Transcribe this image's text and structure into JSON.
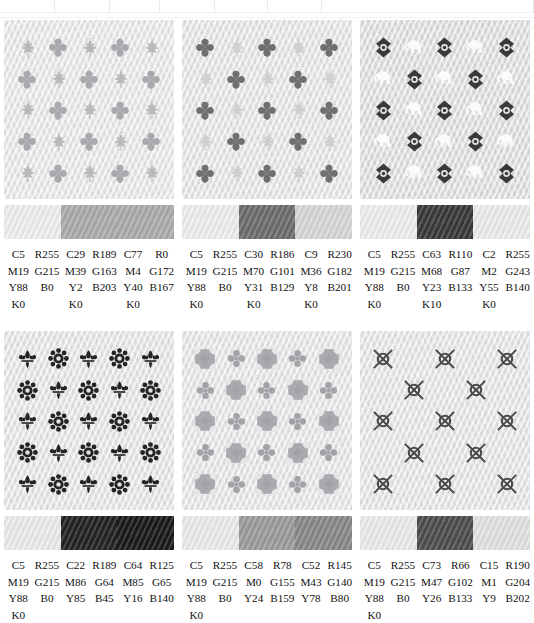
{
  "table_fragment": {
    "visible": true,
    "column_edges_px": [
      55,
      110,
      160,
      215,
      268,
      322,
      534
    ]
  },
  "swatch_rows": [
    {
      "blocks": [
        {
          "pattern": {
            "name": "leaf-and-clover-grid",
            "background": "#e9e9eb",
            "motif_a": "maple-leaf",
            "motif_b": "clover",
            "motif_a_color": "#b9b9bc",
            "motif_b_color": "#a9a9ad",
            "columns": 5,
            "rows": 5
          },
          "bar_segments": [
            "#f0f0ef",
            "#adadad",
            "#adadad"
          ],
          "colors": [
            {
              "c": "C5",
              "m": "M19",
              "y": "Y88",
              "k": "K0",
              "r": "R255",
              "g": "G215",
              "b": "B0"
            },
            {
              "c": "C29",
              "m": "M39",
              "y": "Y2",
              "k": "K0",
              "r": "R189",
              "g": "G163",
              "b": "B203"
            },
            {
              "c": "C77",
              "m": "M4",
              "y": "Y40",
              "k": "K0",
              "r": "R0",
              "g": "G172",
              "b": "B167"
            }
          ]
        },
        {
          "pattern": {
            "name": "clover-and-leaf-grid",
            "background": "#e6e6e8",
            "motif_a": "clover",
            "motif_b": "maple-leaf",
            "motif_a_color": "#6f6f72",
            "motif_b_color": "#cfcfd2",
            "columns": 5,
            "rows": 5
          },
          "bar_segments": [
            "#efefee",
            "#6e6e6e",
            "#d8d8d6"
          ],
          "colors": [
            {
              "c": "C5",
              "m": "M19",
              "y": "Y88",
              "k": "K0",
              "r": "R255",
              "g": "G215",
              "b": "B0"
            },
            {
              "c": "C30",
              "m": "M70",
              "y": "Y31",
              "k": "K0",
              "r": "R186",
              "g": "G101",
              "b": "B129"
            },
            {
              "c": "C9",
              "m": "M36",
              "y": "Y8",
              "k": "K0",
              "r": "R230",
              "g": "G182",
              "b": "B201"
            }
          ]
        },
        {
          "pattern": {
            "name": "rosette-and-elephant-grid",
            "background": "#dededf",
            "motif_a": "rosette-diamond",
            "motif_b": "elephant",
            "motif_a_color": "#3a3a3c",
            "motif_b_color": "#fbfbfb",
            "columns": 5,
            "rows": 5
          },
          "bar_segments": [
            "#efefee",
            "#3b3b3b",
            "#ededeb"
          ],
          "colors": [
            {
              "c": "C5",
              "m": "M19",
              "y": "Y88",
              "k": "K0",
              "r": "R255",
              "g": "G215",
              "b": "B0"
            },
            {
              "c": "C63",
              "m": "M68",
              "y": "Y23",
              "k": "K10",
              "r": "R110",
              "g": "G87",
              "b": "B133"
            },
            {
              "c": "C2",
              "m": "M2",
              "y": "Y55",
              "k": "K0",
              "r": "R255",
              "g": "G243",
              "b": "B140"
            }
          ]
        }
      ]
    },
    {
      "blocks": [
        {
          "pattern": {
            "name": "fleur-de-lis-and-rosette-grid",
            "background": "#e6e6e8",
            "motif_a": "fleur-de-lis",
            "motif_b": "floral-rosette",
            "motif_a_color": "#242426",
            "motif_b_color": "#242426",
            "columns": 5,
            "rows": 5
          },
          "bar_segments": [
            "#ececeb",
            "#242424",
            "#1b1b1b"
          ],
          "colors": [
            {
              "c": "C5",
              "m": "M19",
              "y": "Y88",
              "k": "K0",
              "r": "R255",
              "g": "G215",
              "b": "B0"
            },
            {
              "c": "C22",
              "m": "M86",
              "y": "Y85",
              "k": "",
              "r": "R189",
              "g": "G64",
              "b": "B45"
            },
            {
              "c": "C64",
              "m": "M85",
              "y": "Y16",
              "k": "",
              "r": "R125",
              "g": "G65",
              "b": "B140"
            }
          ]
        },
        {
          "pattern": {
            "name": "damask-square-and-cross-grid",
            "background": "#e7e7e9",
            "motif_a": "damask-square",
            "motif_b": "quatrefoil-cross",
            "motif_a_color": "#a3a3a7",
            "motif_b_color": "#a3a3a7",
            "columns": 5,
            "rows": 5
          },
          "bar_segments": [
            "#ececeb",
            "#9d9d9d",
            "#8a8a8a"
          ],
          "colors": [
            {
              "c": "C5",
              "m": "M19",
              "y": "Y88",
              "k": "K0",
              "r": "R255",
              "g": "G215",
              "b": "B0"
            },
            {
              "c": "C58",
              "m": "M0",
              "y": "Y24",
              "k": "",
              "r": "R78",
              "g": "G155",
              "b": "B159"
            },
            {
              "c": "C52",
              "m": "M43",
              "y": "Y78",
              "k": "",
              "r": "R145",
              "g": "G140",
              "b": "B80"
            }
          ]
        },
        {
          "pattern": {
            "name": "crossed-circle-grid",
            "background": "#e6e6e8",
            "motif_a": "crossed-circle",
            "motif_b": "blank",
            "motif_a_color": "#4a4a4d",
            "motif_b_color": "transparent",
            "columns": 5,
            "rows": 5
          },
          "bar_segments": [
            "#ececeb",
            "#4f4f4f",
            "#e3e3e1"
          ],
          "colors": [
            {
              "c": "C5",
              "m": "M19",
              "y": "Y88",
              "k": "K0",
              "r": "R255",
              "g": "G215",
              "b": "B0"
            },
            {
              "c": "C73",
              "m": "M47",
              "y": "Y26",
              "k": "",
              "r": "R66",
              "g": "G102",
              "b": "B133"
            },
            {
              "c": "C15",
              "m": "M1",
              "y": "Y9",
              "k": "",
              "r": "R190",
              "g": "G204",
              "b": "B202"
            }
          ]
        }
      ]
    }
  ]
}
